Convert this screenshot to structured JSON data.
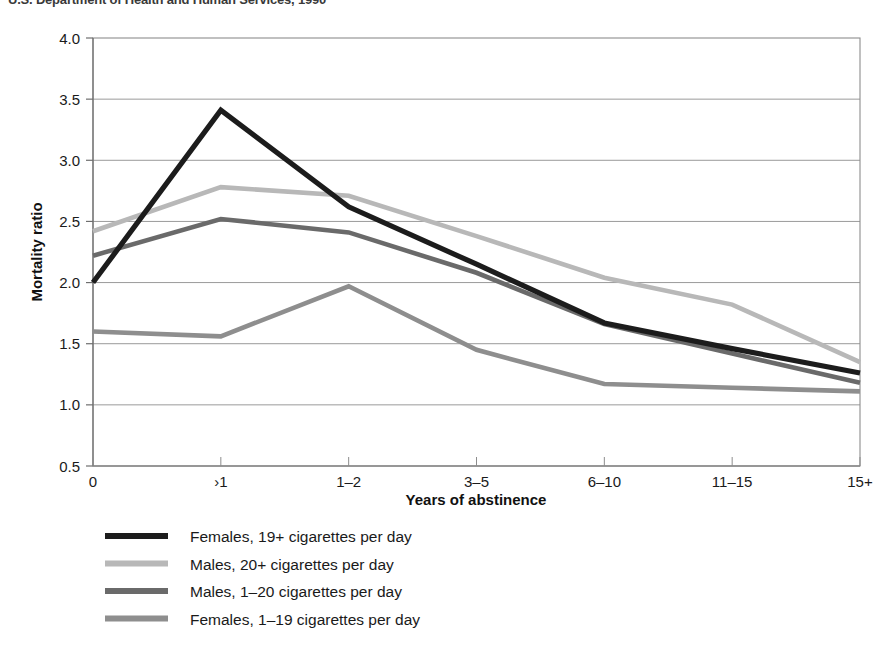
{
  "header": {
    "clipped_source_line": "U.S. Department of Health and Human Services, 1990"
  },
  "chart_data": {
    "type": "line",
    "title": "",
    "xlabel": "Years of abstinence",
    "ylabel": "Mortality ratio",
    "categories": [
      "0",
      "<1",
      "1–2",
      "3–5",
      "6–10",
      "11–15",
      "15+"
    ],
    "x_tick_labels": [
      "0",
      "›1",
      "1–2",
      "3–5",
      "6–10",
      "11–15",
      "15+"
    ],
    "ylim": [
      0.5,
      4.0
    ],
    "y_ticks": [
      "0.5",
      "1.0",
      "1.5",
      "2.0",
      "2.5",
      "3.0",
      "3.5",
      "4.0"
    ],
    "y_tick_values": [
      0.5,
      1.0,
      1.5,
      2.0,
      2.5,
      3.0,
      3.5,
      4.0
    ],
    "grid": true,
    "legend_position": "below",
    "series": [
      {
        "name": "Females, 19+ cigarettes per day",
        "color": "#1c1c1c",
        "values": [
          2.0,
          3.41,
          2.62,
          2.15,
          1.67,
          1.46,
          1.26
        ]
      },
      {
        "name": "Males, 20+ cigarettes per day",
        "color": "#b8b8b8",
        "values": [
          2.42,
          2.78,
          2.71,
          2.38,
          2.04,
          1.82,
          1.35
        ]
      },
      {
        "name": "Males, 1–20 cigarettes per day",
        "color": "#6a6a6a",
        "values": [
          2.22,
          2.52,
          2.41,
          2.08,
          1.66,
          1.42,
          1.18
        ]
      },
      {
        "name": "Females, 1–19 cigarettes per day",
        "color": "#8e8e8e",
        "values": [
          1.6,
          1.56,
          1.97,
          1.45,
          1.17,
          1.14,
          1.11
        ]
      }
    ]
  },
  "legend": {
    "items": [
      {
        "label": "Females, 19+ cigarettes per day",
        "color": "#1c1c1c"
      },
      {
        "label": "Males, 20+ cigarettes per day",
        "color": "#b8b8b8"
      },
      {
        "label": "Males, 1–20 cigarettes per day",
        "color": "#6a6a6a"
      },
      {
        "label": "Females, 1–19 cigarettes per day",
        "color": "#8e8e8e"
      }
    ]
  }
}
